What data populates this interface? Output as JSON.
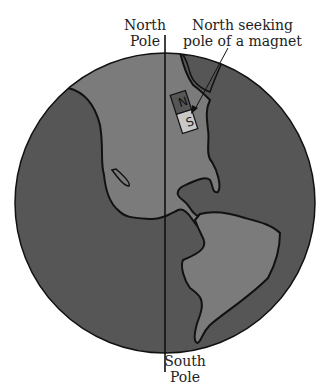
{
  "diagram": {
    "labels": {
      "north_pole": [
        "North",
        "Pole"
      ],
      "south_pole": [
        "South",
        "Pole"
      ],
      "magnet_callout": [
        "North seeking",
        "pole of a magnet"
      ]
    },
    "magnet": {
      "north_letter": "N",
      "south_letter": "S"
    },
    "colors": {
      "ocean": "#565656",
      "land": "#7b7b7b",
      "magnet_south": "#c8c8c8",
      "outline": "#111111"
    }
  }
}
